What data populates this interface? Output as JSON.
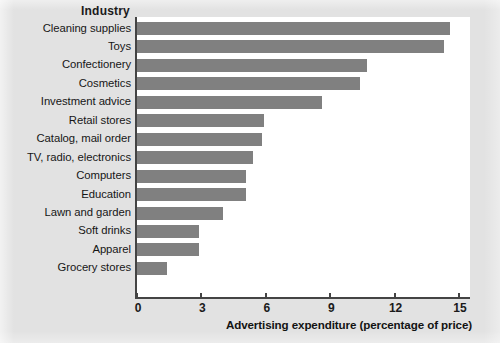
{
  "figure": {
    "category_header": "Industry",
    "background_color": "#e2e2e2",
    "plot_background_color": "#ffffff",
    "bar_color": "#808080",
    "axis_color": "#444444"
  },
  "chart_data": {
    "type": "bar",
    "orientation": "horizontal",
    "title": "",
    "xlabel": "Advertising expenditure (percentage of price)",
    "ylabel": "Industry",
    "xlim": [
      0,
      15.5
    ],
    "xticks": [
      0,
      3,
      6,
      9,
      12,
      15
    ],
    "xtick_labels": [
      "0",
      "3",
      "6",
      "9",
      "12",
      "15"
    ],
    "grid": false,
    "legend": false,
    "categories": [
      "Cleaning supplies",
      "Toys",
      "Confectionery",
      "Cosmetics",
      "Investment advice",
      "Retail stores",
      "Catalog, mail order",
      "TV, radio, electronics",
      "Computers",
      "Education",
      "Lawn and garden",
      "Soft drinks",
      "Apparel",
      "Grocery stores"
    ],
    "values": [
      14.6,
      14.3,
      10.7,
      10.4,
      8.6,
      5.9,
      5.8,
      5.4,
      5.1,
      5.1,
      4.0,
      2.9,
      2.9,
      1.4
    ]
  }
}
